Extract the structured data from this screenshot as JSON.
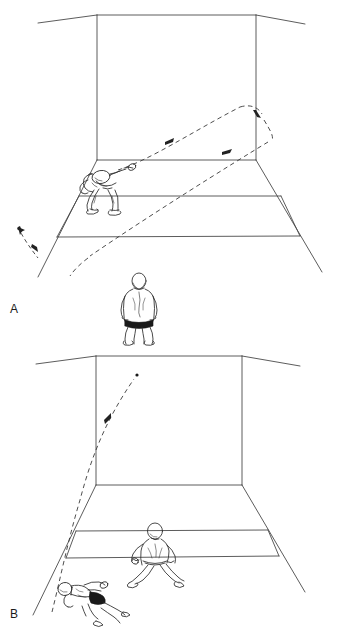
{
  "figure": {
    "title": "",
    "background_color": "#ffffff",
    "line_color": "#3a3a3a",
    "ink_color": "#1a1a1a",
    "dash_color": "#444444",
    "width": 337,
    "height": 635
  },
  "panels": [
    {
      "id": "panel-a",
      "label": "A",
      "subject": "squash-court-perspective-view",
      "court": {
        "back_wall": {
          "top_left": [
            97,
            15
          ],
          "top_right": [
            256,
            15
          ],
          "bottom_left": [
            97,
            160
          ],
          "bottom_right": [
            256,
            160
          ]
        },
        "ceiling_edges": {
          "left_end": [
            38,
            23
          ],
          "right_end": [
            305,
            24
          ]
        },
        "floor": {
          "near_left": [
            38,
            275
          ],
          "near_right": [
            320,
            272
          ]
        },
        "floor_lines": [
          {
            "name": "short-line",
            "left": [
              57,
              237
            ],
            "right": [
              300,
              236
            ]
          },
          {
            "name": "service-box-line",
            "left": [
              79,
              196
            ],
            "right": [
              281,
              196
            ]
          }
        ],
        "side_box_verticals": [
          {
            "top": [
              79,
              196
            ],
            "bottom": [
              57,
              237
            ]
          },
          {
            "top": [
              281,
              196
            ],
            "bottom": [
              300,
              236
            ]
          }
        ]
      },
      "figures": [
        {
          "name": "striking-player",
          "pose": "lunging-forehand-drive",
          "position": [
            100,
            190
          ],
          "facing": "right"
        },
        {
          "name": "seated-observer",
          "pose": "seated-back-view",
          "position": [
            139,
            300
          ],
          "facing": "away"
        }
      ],
      "trajectories": [
        {
          "name": "outgoing-shot",
          "style": "dashed",
          "description": "ball rises from racquet toward back wall upper right",
          "arrowheads": 1
        },
        {
          "name": "side-wall-rebound",
          "style": "dashed",
          "description": "ball rebounds off right side wall and travels back to the left, out of court",
          "arrowheads": 2
        },
        {
          "name": "exit-arrow",
          "style": "dashed",
          "description": "short arrow outside left court boundary indicating ball leaving",
          "arrowheads": 1
        }
      ]
    },
    {
      "id": "panel-b",
      "label": "B",
      "subject": "squash-court-perspective-view",
      "court": {
        "back_wall": {
          "top_left": [
            96,
            356
          ],
          "top_right": [
            242,
            356
          ],
          "bottom_left": [
            96,
            485
          ],
          "bottom_right": [
            242,
            485
          ]
        },
        "ceiling_edges": {
          "left_end": [
            36,
            364
          ],
          "right_end": [
            300,
            365
          ]
        },
        "floor": {
          "near_left": [
            33,
            613
          ],
          "near_right": [
            305,
            592
          ]
        },
        "floor_lines": [
          {
            "name": "short-line",
            "left": [
              66,
              558
            ],
            "right": [
              279,
              556
            ]
          },
          {
            "name": "service-box-line",
            "left": [
              76,
              531
            ],
            "right": [
              268,
              530
            ]
          }
        ],
        "side_box_verticals": [
          {
            "top": [
              76,
              531
            ],
            "bottom": [
              66,
              558
            ]
          },
          {
            "top": [
              268,
              530
            ],
            "bottom": [
              279,
              556
            ]
          }
        ]
      },
      "figures": [
        {
          "name": "ready-player",
          "pose": "crouched-ready-stance-with-racquet",
          "position": [
            155,
            545
          ],
          "facing": "front"
        },
        {
          "name": "diving-player",
          "pose": "low-lunge-retrieve",
          "position": [
            78,
            600
          ],
          "facing": "right"
        }
      ],
      "trajectories": [
        {
          "name": "lofted-lob",
          "style": "dashed",
          "description": "ball rises steeply from low left up toward front wall high right",
          "arrowheads": 1,
          "end_marker": "dot"
        }
      ]
    }
  ]
}
